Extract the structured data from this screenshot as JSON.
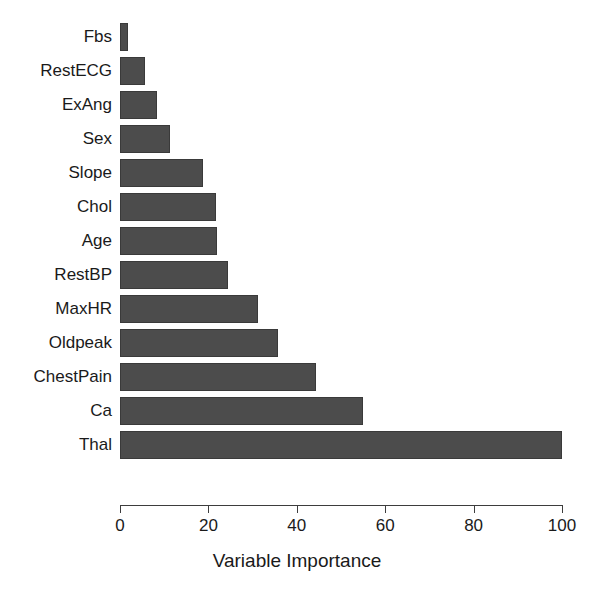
{
  "chart_data": {
    "type": "bar",
    "orientation": "horizontal",
    "title": "",
    "xlabel": "Variable Importance",
    "ylabel": "",
    "xlim": [
      0,
      100
    ],
    "xticks": [
      0,
      20,
      40,
      60,
      80,
      100
    ],
    "grid": false,
    "legend": null,
    "bar_color": "#4c4c4c",
    "bar_border_color": "#3a3a3a",
    "axis_color": "#3d3d3d",
    "text_color": "#1a1a1a",
    "categories": [
      "Fbs",
      "RestECG",
      "ExAng",
      "Sex",
      "Slope",
      "Chol",
      "Age",
      "RestBP",
      "MaxHR",
      "Oldpeak",
      "ChestPain",
      "Ca",
      "Thal"
    ],
    "values": [
      1.8,
      5.6,
      8.4,
      11.3,
      18.8,
      21.7,
      21.9,
      24.4,
      31.2,
      35.7,
      44.3,
      55.0,
      100.0
    ],
    "series": [
      {
        "name": "Variable Importance",
        "values": [
          1.8,
          5.6,
          8.4,
          11.3,
          18.8,
          21.7,
          21.9,
          24.4,
          31.2,
          35.7,
          44.3,
          55.0,
          100.0
        ]
      }
    ]
  }
}
